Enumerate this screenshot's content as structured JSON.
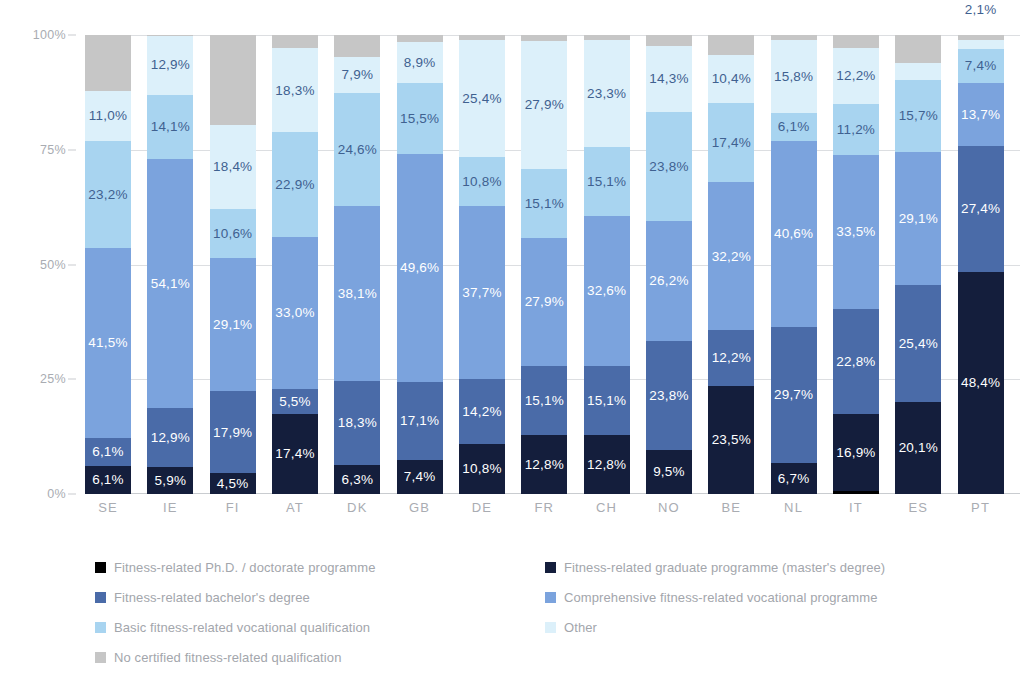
{
  "chart_data": {
    "type": "bar",
    "subtype": "stacked-bar-100-percent",
    "title": "",
    "xlabel": "",
    "ylabel": "",
    "ylim": [
      0,
      100
    ],
    "ytick_labels": [
      "0%",
      "25%",
      "50%",
      "75%",
      "100%"
    ],
    "ytick_values": [
      0,
      25,
      50,
      75,
      100
    ],
    "grid": true,
    "legend_position": "bottom",
    "value_format": "comma-decimal-percent",
    "categories": [
      "SE",
      "IE",
      "FI",
      "AT",
      "DK",
      "GB",
      "DE",
      "FR",
      "CH",
      "NO",
      "BE",
      "NL",
      "IT",
      "ES",
      "PT"
    ],
    "series": [
      {
        "name": "Fitness-related Ph.D. / doctorate programme",
        "color": "#000000",
        "values": [
          0.0,
          0.0,
          0.0,
          0.0,
          0.0,
          0.0,
          0.0,
          0.0,
          0.0,
          0.0,
          0.0,
          0.0,
          0.6,
          0.0,
          0.0
        ],
        "labels": [
          "",
          "",
          "",
          "",
          "",
          "",
          "",
          "",
          "",
          "",
          "",
          "",
          "",
          "",
          ""
        ]
      },
      {
        "name": "Fitness-related graduate programme (master's degree)",
        "color": "#141e3c",
        "values": [
          6.1,
          5.9,
          4.5,
          17.4,
          6.3,
          7.4,
          10.8,
          12.8,
          12.8,
          9.5,
          23.5,
          6.7,
          16.9,
          20.1,
          48.4
        ],
        "labels": [
          "6,1%",
          "5,9%",
          "4,5%",
          "17,4%",
          "6,3%",
          "7,4%",
          "10,8%",
          "12,8%",
          "12,8%",
          "9,5%",
          "23,5%",
          "6,7%",
          "16,9%",
          "20,1%",
          "48,4%"
        ]
      },
      {
        "name": "Fitness-related bachelor's degree",
        "color": "#4a6ba8",
        "values": [
          6.1,
          12.9,
          17.9,
          5.5,
          18.3,
          17.1,
          14.2,
          15.1,
          15.1,
          23.8,
          12.2,
          29.7,
          22.8,
          25.4,
          27.4
        ],
        "labels": [
          "6,1%",
          "12,9%",
          "17,9%",
          "5,5%",
          "18,3%",
          "17,1%",
          "14,2%",
          "15,1%",
          "15,1%",
          "23,8%",
          "12,2%",
          "29,7%",
          "22,8%",
          "25,4%",
          "27,4%"
        ]
      },
      {
        "name": "Comprehensive fitness-related vocational programme",
        "color": "#7ba3dd",
        "values": [
          41.5,
          54.1,
          29.1,
          33.0,
          38.1,
          49.6,
          37.7,
          27.9,
          32.6,
          26.2,
          32.2,
          40.6,
          33.5,
          29.1,
          13.7
        ],
        "labels": [
          "41,5%",
          "54,1%",
          "29,1%",
          "33,0%",
          "38,1%",
          "49,6%",
          "37,7%",
          "27,9%",
          "32,6%",
          "26,2%",
          "32,2%",
          "40,6%",
          "33,5%",
          "29,1%",
          "13,7%"
        ]
      },
      {
        "name": "Basic fitness-related vocational qualification",
        "color": "#a8d4f0",
        "values": [
          23.2,
          14.1,
          10.6,
          22.9,
          24.6,
          15.5,
          10.8,
          15.1,
          15.1,
          23.8,
          17.4,
          6.1,
          11.2,
          15.7,
          7.4
        ],
        "labels": [
          "23,2%",
          "14,1%",
          "10,6%",
          "22,9%",
          "24,6%",
          "15,5%",
          "10,8%",
          "15,1%",
          "15,1%",
          "23,8%",
          "17,4%",
          "6,1%",
          "11,2%",
          "15,7%",
          "7,4%"
        ]
      },
      {
        "name": "Other",
        "color": "#dcf0fa",
        "values": [
          11.0,
          12.9,
          18.4,
          18.3,
          7.9,
          8.9,
          25.4,
          27.9,
          23.3,
          14.3,
          10.4,
          15.8,
          12.2,
          3.7,
          2.1
        ],
        "labels": [
          "11,0%",
          "12,9%",
          "18,4%",
          "18,3%",
          "7,9%",
          "8,9%",
          "25,4%",
          "27,9%",
          "23,3%",
          "14,3%",
          "10,4%",
          "15,8%",
          "12,2%",
          "3,7%",
          "2,1%"
        ]
      },
      {
        "name": "No certified fitness-related qualification",
        "color": "#c6c6c6",
        "values": [
          12.1,
          0.1,
          19.5,
          2.9,
          4.8,
          1.5,
          1.1,
          1.2,
          1.1,
          2.4,
          4.3,
          1.1,
          2.8,
          6.0,
          1.0
        ],
        "labels": [
          "",
          "",
          "",
          "",
          "",
          "",
          "",
          "",
          "",
          "",
          "",
          "",
          "",
          "",
          ""
        ]
      }
    ]
  },
  "legend": {
    "items": [
      {
        "label": "Fitness-related Ph.D. / doctorate programme",
        "color": "#000000"
      },
      {
        "label": "Fitness-related graduate programme (master's degree)",
        "color": "#141e3c"
      },
      {
        "label": "Fitness-related bachelor's degree",
        "color": "#4a6ba8"
      },
      {
        "label": "Comprehensive fitness-related vocational programme",
        "color": "#7ba3dd"
      },
      {
        "label": "Basic fitness-related vocational qualification",
        "color": "#a8d4f0"
      },
      {
        "label": "Other",
        "color": "#dcf0fa"
      },
      {
        "label": "No certified fitness-related qualification",
        "color": "#c6c6c6"
      }
    ]
  },
  "colors": {
    "grid": "#dcdee1",
    "axis_text": "#a9acb2",
    "label_dark": "#3f6190",
    "label_light": "#ffffff",
    "background": "#ffffff"
  }
}
